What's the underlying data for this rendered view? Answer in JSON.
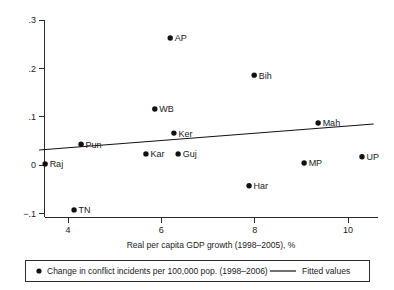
{
  "chart_data": {
    "type": "scatter",
    "title": "",
    "subtitle": "",
    "xlabel": "Real per capita GDP growth (1998–2005), %",
    "ylabel": "",
    "xlim": [
      3.35,
      10.75
    ],
    "ylim": [
      -0.13,
      0.315
    ],
    "xticks": [
      4,
      6,
      8,
      10
    ],
    "xtick_labels": [
      "4",
      "6",
      "8",
      "10"
    ],
    "yticks": [
      -0.1,
      0,
      0.1,
      0.2,
      0.3
    ],
    "ytick_labels": [
      "−.1",
      "0",
      ".1",
      ".2",
      ".3"
    ],
    "grid": false,
    "legend_position": "below-axes",
    "series": [
      {
        "name": "Change in conflict incidents per 100,000 pop. (1998–2006)",
        "marker": "filled-circle",
        "color": "#111111",
        "points": [
          {
            "label": "Raj",
            "x": 3.51,
            "y": 0.002
          },
          {
            "label": "TN",
            "x": 4.13,
            "y": -0.093
          },
          {
            "label": "Pun",
            "x": 4.28,
            "y": 0.043
          },
          {
            "label": "Kar",
            "x": 5.67,
            "y": 0.023
          },
          {
            "label": "WB",
            "x": 5.86,
            "y": 0.116
          },
          {
            "label": "AP",
            "x": 6.19,
            "y": 0.263
          },
          {
            "label": "Ker",
            "x": 6.27,
            "y": 0.066
          },
          {
            "label": "Guj",
            "x": 6.36,
            "y": 0.023
          },
          {
            "label": "Har",
            "x": 7.88,
            "y": -0.043
          },
          {
            "label": "Bih",
            "x": 7.99,
            "y": 0.186
          },
          {
            "label": "MP",
            "x": 9.06,
            "y": 0.004
          },
          {
            "label": "Mah",
            "x": 9.36,
            "y": 0.087
          },
          {
            "label": "UP",
            "x": 10.3,
            "y": 0.017
          }
        ]
      },
      {
        "name": "Fitted values",
        "marker": "line",
        "color": "#111111",
        "line": {
          "x1": 3.38,
          "y1": 0.031,
          "x2": 10.55,
          "y2": 0.085
        }
      }
    ]
  },
  "legend": {
    "scatter_label": "Change in conflict incidents per 100,000 pop. (1998–2006)",
    "fit_label": "Fitted values"
  },
  "axes": {
    "x_title": "Real per capita GDP growth (1998–2005), %"
  }
}
